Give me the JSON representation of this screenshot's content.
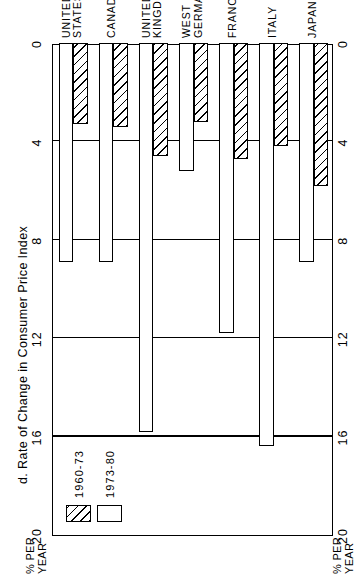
{
  "chart_data": {
    "type": "bar",
    "orientation": "horizontal",
    "title": "d.  Rate of Change in Consumer Price Index",
    "xlabel": "",
    "ylabel": "",
    "axis_caption_lines": [
      "% PER",
      "YEAR"
    ],
    "axis_unit": "% PER YEAR",
    "xlim": [
      0,
      20
    ],
    "ticks": [
      20,
      16,
      12,
      8,
      4,
      0
    ],
    "tick_labels": [
      "20",
      "16",
      "12",
      "8",
      "4",
      "0"
    ],
    "gridlines": [
      16,
      12,
      8,
      4
    ],
    "grid": true,
    "legend_position": "upper-left",
    "categories": [
      "UNITED STATES",
      "CANADA",
      "UNITED KINGDOM",
      "WEST GERMANY",
      "FRANCE",
      "ITALY",
      "JAPAN"
    ],
    "category_label_lines": [
      [
        "UNITED",
        "STATES"
      ],
      [
        "CANADA"
      ],
      [
        "UNITED",
        "KINGDOM"
      ],
      [
        "WEST",
        "GERMANY"
      ],
      [
        "FRANCE"
      ],
      [
        "ITALY"
      ],
      [
        "JAPAN"
      ]
    ],
    "series": [
      {
        "name": "1960-73",
        "pattern": "hatched",
        "values": [
          3.3,
          3.4,
          4.6,
          3.2,
          4.7,
          4.2,
          5.8
        ]
      },
      {
        "name": "1973-80",
        "pattern": "white",
        "values": [
          8.9,
          8.9,
          15.8,
          5.2,
          11.8,
          16.4,
          8.9
        ]
      }
    ]
  },
  "legend": {
    "entries": [
      {
        "label": "1960-73",
        "pattern": "hatched"
      },
      {
        "label": "1973-80",
        "pattern": "white"
      }
    ]
  },
  "colors": {
    "ink": "#000000",
    "paper": "#ffffff"
  }
}
